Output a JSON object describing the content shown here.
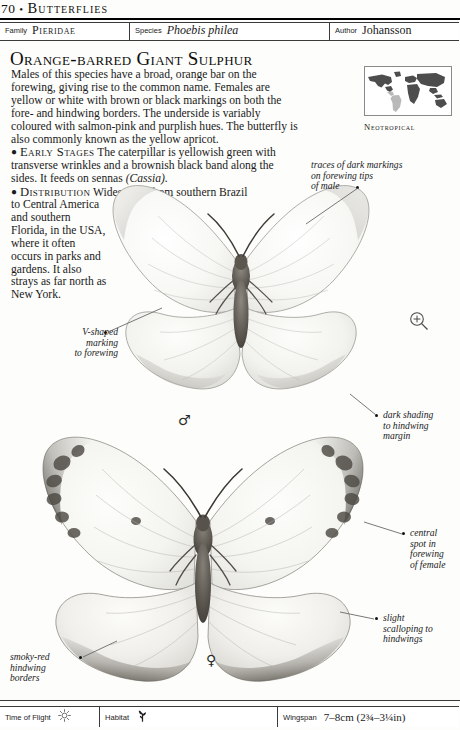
{
  "running_head": {
    "folio": "70",
    "separator": "•",
    "title": "Butterflies"
  },
  "taxonomy": {
    "family_label": "Family",
    "family_value": "Pieridae",
    "species_label": "Species",
    "species_value": "Phoebis philea",
    "author_label": "Author",
    "author_value": "Johansson"
  },
  "headline": "Orange-barred Giant Sulphur",
  "body": {
    "intro": "Males of this species have a broad, orange bar on the forewing, giving rise to the common name. Females are yellow or white with brown or black markings on both the fore- and hindwing borders. The underside is variably coloured with salmon-pink and purplish hues. The butterfly is also commonly known as the yellow apricot.",
    "early_stages_lead": "Early Stages",
    "early_stages_text_before_italic": " The caterpillar is yellowish green with transverse wrinkles and a brownish black band along the sides. It feeds on sennas ",
    "early_stages_italic": "(Cassia).",
    "distribution_lead": "Distribution",
    "distribution_first_line": " Widespread from southern Brazil",
    "distribution_rest": "to Central America and southern Florida, in the USA, where it often occurs in parks and gardens. It also strays as far north as New York."
  },
  "map": {
    "caption": "Neotropical",
    "land_color": "#4d4d4d",
    "highlight_color": "#b9b9b9",
    "border_color": "#8a8a8a"
  },
  "icons": {
    "magnifier": "magnifier-plus-icon",
    "sun": "sun-icon",
    "habitat_plant": "plant-icon"
  },
  "annotations": [
    {
      "id": "male-forewing-tips",
      "text": "traces of dark markings\non forewing tips\nof male"
    },
    {
      "id": "v-shaped-marking",
      "text": "V-shaped\nmarking\nto forewing"
    },
    {
      "id": "dark-shading-hindwing",
      "text": "dark shading\nto hindwing\nmargin"
    },
    {
      "id": "central-spot-female",
      "text": "central\nspot in\nforewing\nof female"
    },
    {
      "id": "slight-scalloping",
      "text": "slight\nscalloping to\nhindwings"
    },
    {
      "id": "smoky-red-borders",
      "text": "smoky-red\nhindwing\nborders"
    }
  ],
  "gender_symbols": {
    "male": "♂",
    "female": "♀"
  },
  "footer": {
    "time_of_flight_label": "Time of Flight",
    "habitat_label": "Habitat",
    "wingspan_label": "Wingspan",
    "wingspan_value": "7–8cm (2¾–3¼in)"
  }
}
